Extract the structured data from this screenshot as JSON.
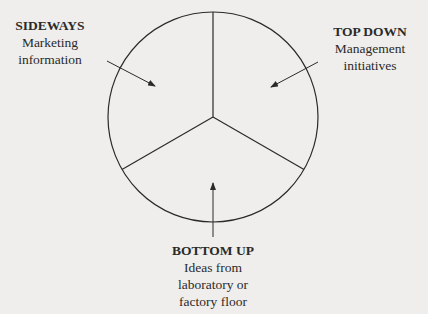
{
  "diagram": {
    "type": "segmented-circle",
    "segments": 3,
    "sources": [
      {
        "id": "sideways",
        "heading": "SIDEWAYS",
        "lines": [
          "Marketing",
          "information"
        ]
      },
      {
        "id": "top-down",
        "heading": "TOP DOWN",
        "lines": [
          "Management",
          "initiatives"
        ]
      },
      {
        "id": "bottom-up",
        "heading": "BOTTOM UP",
        "lines": [
          "Ideas from",
          "laboratory or",
          "factory floor"
        ]
      }
    ]
  }
}
